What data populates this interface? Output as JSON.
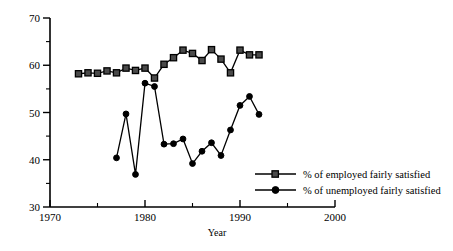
{
  "chart_data": {
    "type": "line",
    "title": "",
    "xlabel": "Year",
    "ylabel": "",
    "xlim": [
      1970,
      2000
    ],
    "ylim": [
      30,
      70
    ],
    "x_ticks": [
      1970,
      1980,
      1990,
      2000
    ],
    "x_tick_labels": [
      "1970",
      "1980",
      "1990",
      "2000"
    ],
    "x_minor_ticks": [
      1975,
      1985,
      1995
    ],
    "y_ticks": [
      30,
      40,
      50,
      60,
      70
    ],
    "y_tick_labels": [
      "30",
      "40",
      "50",
      "60",
      "70"
    ],
    "y_minor_ticks": [
      35,
      45,
      55,
      65
    ],
    "grid": false,
    "legend_position": "center-right",
    "series": [
      {
        "name": "% of employed fairly satisfied",
        "marker": "square",
        "x": [
          1973,
          1974,
          1975,
          1976,
          1977,
          1978,
          1979,
          1980,
          1981,
          1982,
          1983,
          1984,
          1985,
          1986,
          1987,
          1988,
          1989,
          1990,
          1991,
          1992
        ],
        "values": [
          58.2,
          58.4,
          58.3,
          58.8,
          58.4,
          59.4,
          58.9,
          59.4,
          57.3,
          60.2,
          61.6,
          63.2,
          62.5,
          61.0,
          63.3,
          61.3,
          58.4,
          63.2,
          62.2,
          62.2
        ]
      },
      {
        "name": "% of unemployed fairly satisfied",
        "marker": "circle",
        "x": [
          1977,
          1978,
          1979,
          1980,
          1981,
          1982,
          1983,
          1984,
          1985,
          1986,
          1987,
          1988,
          1989,
          1990,
          1991,
          1992
        ],
        "values": [
          40.4,
          49.7,
          36.9,
          56.2,
          55.5,
          43.3,
          43.4,
          44.4,
          39.2,
          41.8,
          43.6,
          40.9,
          46.3,
          51.5,
          53.4,
          49.6
        ]
      }
    ]
  },
  "legend": {
    "items": [
      {
        "label": "% of employed fairly satisfied",
        "marker": "square"
      },
      {
        "label": "% of unemployed fairly satisfied",
        "marker": "circle"
      }
    ]
  },
  "axes": {
    "x_title": "Year"
  }
}
